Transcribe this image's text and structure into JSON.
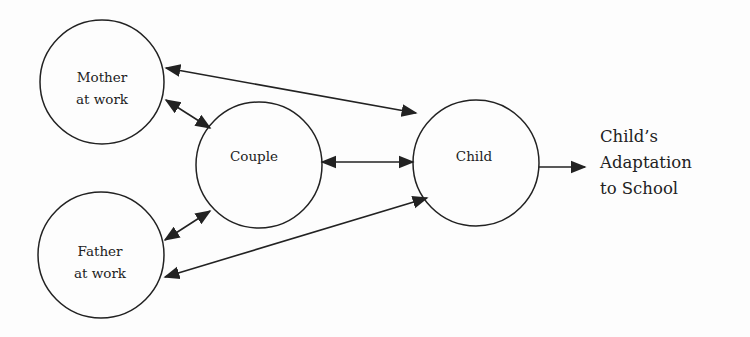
{
  "diagram": {
    "nodes": [
      {
        "id": "mother",
        "label_lines": [
          "Mother",
          "at work"
        ]
      },
      {
        "id": "father",
        "label_lines": [
          "Father",
          "at work"
        ]
      },
      {
        "id": "couple",
        "label_lines": [
          "Couple"
        ]
      },
      {
        "id": "child",
        "label_lines": [
          "Child"
        ]
      }
    ],
    "outcome": {
      "label_lines": [
        "Child’s",
        "Adaptation",
        "to School"
      ]
    },
    "edges": [
      {
        "from": "mother",
        "to": "child",
        "bidirectional": true
      },
      {
        "from": "mother",
        "to": "couple",
        "bidirectional": true
      },
      {
        "from": "father",
        "to": "couple",
        "bidirectional": true
      },
      {
        "from": "father",
        "to": "child",
        "bidirectional": true
      },
      {
        "from": "couple",
        "to": "child",
        "bidirectional": true
      },
      {
        "from": "child",
        "to": "outcome",
        "bidirectional": false
      }
    ],
    "colors": {
      "stroke": "#222222",
      "background": "#fdfdfd"
    }
  }
}
